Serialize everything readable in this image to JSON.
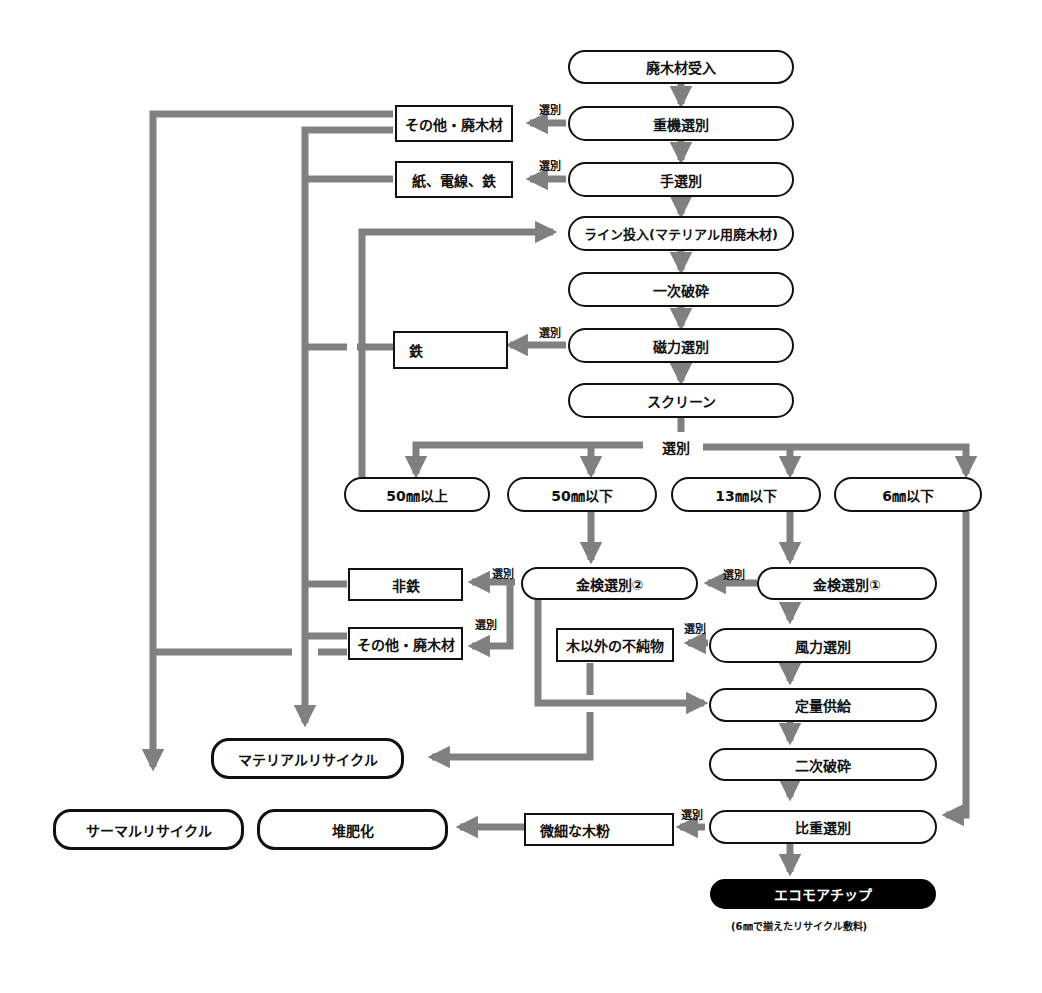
{
  "diagram": {
    "type": "flowchart",
    "colors": {
      "connector": "#808080",
      "node_border": "#111111",
      "final_fill": "#000000",
      "final_text": "#ffffff"
    },
    "process_nodes": [
      {
        "id": "receive",
        "label": "廃木材受入"
      },
      {
        "id": "heavy_sort",
        "label": "重機選別"
      },
      {
        "id": "hand_sort",
        "label": "手選別"
      },
      {
        "id": "line_input",
        "label": "ライン投入(マテリアル用廃木材)"
      },
      {
        "id": "primary_crush",
        "label": "一次破砕"
      },
      {
        "id": "magnetic_sort",
        "label": "磁力選別"
      },
      {
        "id": "screen",
        "label": "スクリーン"
      },
      {
        "id": "over50",
        "label": "50㎜以上"
      },
      {
        "id": "under50",
        "label": "50㎜以下"
      },
      {
        "id": "under13",
        "label": "13㎜以下"
      },
      {
        "id": "under6",
        "label": "6㎜以下"
      },
      {
        "id": "metal_detect2",
        "label": "金検選別②"
      },
      {
        "id": "metal_detect1",
        "label": "金検選別①"
      },
      {
        "id": "wind_sort",
        "label": "風力選別"
      },
      {
        "id": "fixed_feed",
        "label": "定量供給"
      },
      {
        "id": "secondary_crush",
        "label": "二次破砕"
      },
      {
        "id": "gravity_sort",
        "label": "比重選別"
      }
    ],
    "reject_boxes": [
      {
        "id": "other_waste_wood_1",
        "label": "その他・廃木材"
      },
      {
        "id": "paper_wire_iron",
        "label": "紙、電線、鉄"
      },
      {
        "id": "iron",
        "label": "鉄"
      },
      {
        "id": "non_ferrous",
        "label": "非鉄"
      },
      {
        "id": "other_waste_wood_2",
        "label": "その他・廃木材"
      },
      {
        "id": "non_wood_impurities",
        "label": "木以外の不純物"
      },
      {
        "id": "fine_wood_powder",
        "label": "微細な木粉"
      }
    ],
    "outputs": [
      {
        "id": "material_recycle",
        "label": "マテリアルリサイクル"
      },
      {
        "id": "thermal_recycle",
        "label": "サーマルリサイクル"
      },
      {
        "id": "composting",
        "label": "堆肥化"
      }
    ],
    "final_product": {
      "label": "エコモアチップ",
      "caption": "(6㎜で揃えたリサイクル敷料)"
    },
    "edge_label": "選別",
    "screen_split_label": "選別"
  }
}
